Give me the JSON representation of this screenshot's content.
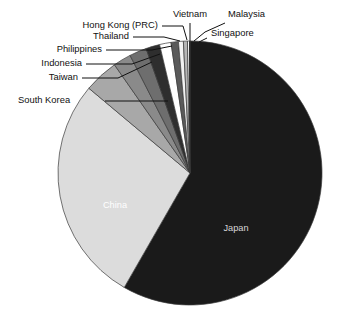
{
  "chart_data": {
    "type": "pie",
    "title": "",
    "subtitle": "",
    "xlabel": "",
    "ylabel": "",
    "legend_position": "callout-labels",
    "grid": false,
    "categories": [
      "Japan",
      "China",
      "South Korea",
      "Taiwan",
      "Indonesia",
      "Philippines",
      "Thailand",
      "Hong Kong (PRC)",
      "Vietnam",
      "Malaysia",
      "Singapore"
    ],
    "values": [
      58.3,
      27.8,
      4.2,
      2.2,
      2.1,
      1.7,
      1.4,
      0.9,
      0.6,
      0.5,
      0.3
    ],
    "unit": "percent",
    "slices": [
      {
        "label": "Japan",
        "value": 58.3,
        "color": "#1a1a1a",
        "label_placement": "inside",
        "label_color": "#ffffff"
      },
      {
        "label": "China",
        "value": 27.8,
        "color": "#dcdcdc",
        "label_placement": "inside",
        "label_color": "#ffffff"
      },
      {
        "label": "South Korea",
        "value": 4.2,
        "color": "#a8a8a8",
        "label_placement": "callout",
        "label_color": "#111111"
      },
      {
        "label": "Taiwan",
        "value": 2.2,
        "color": "#8a8a8a",
        "label_placement": "callout",
        "label_color": "#111111"
      },
      {
        "label": "Indonesia",
        "value": 2.1,
        "color": "#6e6e6e",
        "label_placement": "callout",
        "label_color": "#111111"
      },
      {
        "label": "Philippines",
        "value": 1.7,
        "color": "#2e2e2e",
        "label_placement": "callout",
        "label_color": "#111111"
      },
      {
        "label": "Thailand",
        "value": 1.4,
        "color": "#ffffff",
        "label_placement": "callout",
        "label_color": "#111111"
      },
      {
        "label": "Hong Kong (PRC)",
        "value": 0.9,
        "color": "#5a5a5a",
        "label_placement": "callout",
        "label_color": "#111111"
      },
      {
        "label": "Vietnam",
        "value": 0.6,
        "color": "#f2f2f2",
        "label_placement": "callout",
        "label_color": "#111111"
      },
      {
        "label": "Malaysia",
        "value": 0.5,
        "color": "#b5b5b5",
        "label_placement": "callout",
        "label_color": "#111111"
      },
      {
        "label": "Singapore",
        "value": 0.3,
        "color": "#e8e8e8",
        "label_placement": "callout",
        "label_color": "#111111"
      }
    ]
  },
  "labels": {
    "japan": "Japan",
    "china": "China",
    "south_korea": "South Korea",
    "taiwan": "Taiwan",
    "indonesia": "Indonesia",
    "philippines": "Philippines",
    "thailand": "Thailand",
    "hong_kong": "Hong Kong (PRC)",
    "vietnam": "Vietnam",
    "malaysia": "Malaysia",
    "singapore": "Singapore"
  },
  "colors": {
    "japan": "#1a1a1a",
    "china": "#dcdcdc",
    "south_korea": "#a8a8a8",
    "taiwan": "#8a8a8a",
    "indonesia": "#6e6e6e",
    "philippines": "#2e2e2e",
    "thailand": "#ffffff",
    "hong_kong": "#5a5a5a",
    "vietnam": "#f2f2f2",
    "malaysia": "#b5b5b5",
    "singapore": "#e8e8e8",
    "outline": "#3a3a3a",
    "leader": "#111111",
    "background": "#ffffff"
  }
}
